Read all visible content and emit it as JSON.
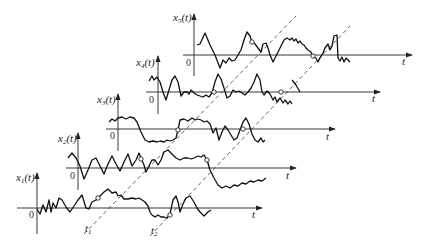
{
  "diagram": {
    "type": "ensemble of random process sample functions",
    "samples": [
      {
        "label": "x1(t)",
        "label_main": "x",
        "label_sub": "1",
        "label_arg": "(t)",
        "origin": "0",
        "time_axis": "t"
      },
      {
        "label": "x2(t)",
        "label_main": "x",
        "label_sub": "2",
        "label_arg": "(t)",
        "origin": "0",
        "time_axis": "t"
      },
      {
        "label": "x3(t)",
        "label_main": "x",
        "label_sub": "3",
        "label_arg": "(t)",
        "origin": "0",
        "time_axis": "t"
      },
      {
        "label": "x4(t)",
        "label_main": "x",
        "label_sub": "4",
        "label_arg": "(t)",
        "origin": "0",
        "time_axis": "t"
      },
      {
        "label": "x5(t)",
        "label_main": "x",
        "label_sub": "5",
        "label_arg": "(t)",
        "origin": "0",
        "time_axis": "t"
      }
    ],
    "time_markers": [
      {
        "label": "t1",
        "main": "t",
        "sub": "1"
      },
      {
        "label": "t2",
        "main": "t",
        "sub": "2"
      }
    ],
    "colors": {
      "line": "#111111",
      "dashed": "#555555",
      "background": "#ffffff"
    }
  }
}
